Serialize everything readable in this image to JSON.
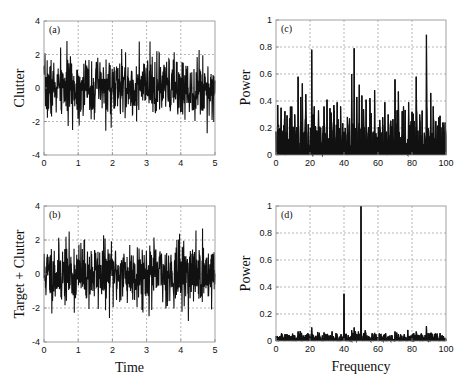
{
  "chart_data": [
    {
      "id": "a",
      "type": "line",
      "panel_label": "(a)",
      "title": "",
      "xlabel": "",
      "ylabel": "Clutter",
      "xlim": [
        0,
        5
      ],
      "ylim": [
        -4,
        4
      ],
      "xticks": [
        "0",
        "1",
        "2",
        "3",
        "4",
        "5"
      ],
      "yticks": [
        "-4",
        "-2",
        "0",
        "2",
        "4"
      ],
      "grid": true,
      "description": "Dense noise time series, approx. +/-2 envelope, peaks near 3.2 and -3.0",
      "amplitude_std": 0.9,
      "max_peak": 3.2,
      "min_peak": -3.0,
      "seed": 7
    },
    {
      "id": "b",
      "type": "line",
      "panel_label": "(b)",
      "title": "",
      "xlabel": "Time",
      "ylabel": "Target + Clutter",
      "xlim": [
        0,
        5
      ],
      "ylim": [
        -4,
        4
      ],
      "xticks": [
        "0",
        "1",
        "2",
        "3",
        "4",
        "5"
      ],
      "yticks": [
        "-4",
        "-2",
        "0",
        "2",
        "4"
      ],
      "grid": true,
      "description": "Dense noise time series with embedded target, approx. +/-2 envelope",
      "amplitude_std": 0.92,
      "max_peak": 3.2,
      "min_peak": -3.0,
      "seed": 11
    },
    {
      "id": "c",
      "type": "bar",
      "panel_label": "(c)",
      "title": "",
      "xlabel": "",
      "ylabel": "Power",
      "xlim": [
        0,
        100
      ],
      "ylim": [
        0,
        1
      ],
      "xticks": [
        "0",
        "20",
        "40",
        "60",
        "80",
        "100"
      ],
      "yticks": [
        "0",
        "0.2",
        "0.4",
        "0.6",
        "0.8",
        "1"
      ],
      "grid": true,
      "baseline_level": 0.12,
      "seed": 23,
      "peaks": [
        {
          "x": 1,
          "y": 0.37
        },
        {
          "x": 3,
          "y": 0.35
        },
        {
          "x": 5,
          "y": 0.27
        },
        {
          "x": 8,
          "y": 0.27
        },
        {
          "x": 11,
          "y": 0.3
        },
        {
          "x": 13,
          "y": 0.58
        },
        {
          "x": 14.5,
          "y": 0.43
        },
        {
          "x": 15.5,
          "y": 0.53
        },
        {
          "x": 17.5,
          "y": 0.45
        },
        {
          "x": 21,
          "y": 0.78
        },
        {
          "x": 22.5,
          "y": 0.36
        },
        {
          "x": 25,
          "y": 0.33
        },
        {
          "x": 30,
          "y": 0.41
        },
        {
          "x": 34,
          "y": 0.37
        },
        {
          "x": 36,
          "y": 0.39
        },
        {
          "x": 38,
          "y": 0.36
        },
        {
          "x": 44.5,
          "y": 0.6
        },
        {
          "x": 46,
          "y": 0.79
        },
        {
          "x": 47.5,
          "y": 0.43
        },
        {
          "x": 49,
          "y": 0.52
        },
        {
          "x": 50.5,
          "y": 0.44
        },
        {
          "x": 53,
          "y": 0.41
        },
        {
          "x": 56,
          "y": 0.31
        },
        {
          "x": 58,
          "y": 0.48
        },
        {
          "x": 61,
          "y": 0.26
        },
        {
          "x": 64,
          "y": 0.39
        },
        {
          "x": 66,
          "y": 0.3
        },
        {
          "x": 70,
          "y": 0.56
        },
        {
          "x": 72,
          "y": 0.47
        },
        {
          "x": 75,
          "y": 0.36
        },
        {
          "x": 78,
          "y": 0.39
        },
        {
          "x": 80,
          "y": 0.32
        },
        {
          "x": 82.5,
          "y": 0.58
        },
        {
          "x": 84.5,
          "y": 0.3
        },
        {
          "x": 86,
          "y": 0.25
        },
        {
          "x": 88.5,
          "y": 0.89
        },
        {
          "x": 91,
          "y": 0.46
        },
        {
          "x": 92.5,
          "y": 0.36
        },
        {
          "x": 94,
          "y": 0.25
        },
        {
          "x": 96.5,
          "y": 0.29
        },
        {
          "x": 99.5,
          "y": 0.24
        }
      ]
    },
    {
      "id": "d",
      "type": "bar",
      "panel_label": "(d)",
      "title": "",
      "xlabel": "Frequency",
      "ylabel": "Power",
      "xlim": [
        0,
        100
      ],
      "ylim": [
        0,
        1
      ],
      "xticks": [
        "0",
        "20",
        "40",
        "60",
        "80",
        "100"
      ],
      "yticks": [
        "0",
        "0.2",
        "0.4",
        "0.6",
        "0.8",
        "1"
      ],
      "grid": true,
      "baseline_level": 0.025,
      "seed": 31,
      "peaks": [
        {
          "x": 13,
          "y": 0.07
        },
        {
          "x": 15,
          "y": 0.06
        },
        {
          "x": 21,
          "y": 0.1
        },
        {
          "x": 30,
          "y": 0.05
        },
        {
          "x": 40,
          "y": 0.35
        },
        {
          "x": 44.5,
          "y": 0.08
        },
        {
          "x": 46,
          "y": 0.1
        },
        {
          "x": 48.5,
          "y": 0.07
        },
        {
          "x": 50,
          "y": 1.0
        },
        {
          "x": 58,
          "y": 0.06
        },
        {
          "x": 70,
          "y": 0.07
        },
        {
          "x": 72,
          "y": 0.05
        },
        {
          "x": 82.5,
          "y": 0.07
        },
        {
          "x": 88.5,
          "y": 0.11
        },
        {
          "x": 91,
          "y": 0.06
        }
      ]
    }
  ],
  "layout": {
    "panels": {
      "a": {
        "left": 44,
        "top": 21,
        "right": 215,
        "bottom": 155
      },
      "b": {
        "left": 44,
        "top": 206,
        "right": 215,
        "bottom": 342
      },
      "c": {
        "left": 276,
        "top": 20,
        "right": 446,
        "bottom": 155
      },
      "d": {
        "left": 276,
        "top": 206,
        "right": 446,
        "bottom": 341
      }
    },
    "colors": {
      "line": "#111111",
      "axis": "#8a8a8a",
      "grid": "#9a9a9a",
      "text": "#111111"
    }
  }
}
